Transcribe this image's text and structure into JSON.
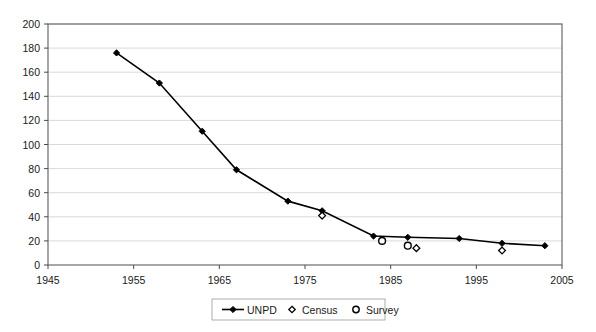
{
  "chart_data": {
    "type": "line",
    "title": "",
    "subtitle": "",
    "xlabel": "",
    "ylabel": "",
    "xlim": [
      1945,
      2005
    ],
    "ylim": [
      0,
      200
    ],
    "xticks": [
      1945,
      1955,
      1965,
      1975,
      1985,
      1995,
      2005
    ],
    "yticks": [
      0,
      20,
      40,
      60,
      80,
      100,
      120,
      140,
      160,
      180,
      200
    ],
    "grid": "horizontal",
    "legend_position": "bottom",
    "series": [
      {
        "name": "UNPD",
        "marker": "filled-diamond",
        "line": true,
        "color": "#000000",
        "points": [
          {
            "x": 1953,
            "y": 176
          },
          {
            "x": 1958,
            "y": 151
          },
          {
            "x": 1963,
            "y": 111
          },
          {
            "x": 1967,
            "y": 79
          },
          {
            "x": 1973,
            "y": 53
          },
          {
            "x": 1977,
            "y": 45
          },
          {
            "x": 1983,
            "y": 24
          },
          {
            "x": 1987,
            "y": 23
          },
          {
            "x": 1993,
            "y": 22
          },
          {
            "x": 1998,
            "y": 18
          },
          {
            "x": 2003,
            "y": 16
          }
        ]
      },
      {
        "name": "Census",
        "marker": "open-diamond",
        "line": false,
        "color": "#000000",
        "points": [
          {
            "x": 1977,
            "y": 41
          },
          {
            "x": 1988,
            "y": 14
          },
          {
            "x": 1998,
            "y": 12
          }
        ]
      },
      {
        "name": "Survey",
        "marker": "open-circle",
        "line": false,
        "color": "#000000",
        "points": [
          {
            "x": 1984,
            "y": 20
          },
          {
            "x": 1987,
            "y": 16
          }
        ]
      }
    ]
  },
  "axis": {
    "y_tick_labels": [
      "200",
      "180",
      "160",
      "140",
      "120",
      "100",
      "80",
      "60",
      "40",
      "20",
      "0"
    ],
    "x_tick_labels": [
      "1945",
      "1955",
      "1965",
      "1975",
      "1985",
      "1995",
      "2005"
    ]
  },
  "legend": {
    "items": [
      {
        "label": "UNPD",
        "icon": "line-with-diamond-marker"
      },
      {
        "label": "Census",
        "icon": "open-diamond-marker"
      },
      {
        "label": "Survey",
        "icon": "open-circle-marker"
      }
    ]
  }
}
